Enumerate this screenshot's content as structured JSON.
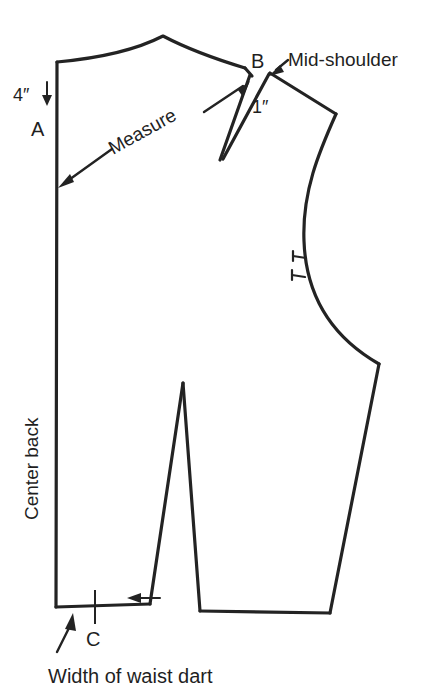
{
  "diagram": {
    "title": "BACK",
    "piece_label": "BACK",
    "labels": {
      "point_a": "A",
      "point_b": "B",
      "point_c": "C",
      "center_back": "Center back",
      "measure": "Measure",
      "mid_shoulder": "Mid-shoulder",
      "dim_four_inch": "4″",
      "dim_one_inch": "1″",
      "caption_waist_dart": "Width of waist dart"
    },
    "measurements": [
      {
        "id": "neck-drop",
        "value": "4″",
        "description": "distance down center back from neckline to point A"
      },
      {
        "id": "shoulder-dart-width",
        "value": "1″",
        "description": "width of shoulder dart at point B"
      }
    ],
    "points": [
      {
        "id": "A",
        "label": "A",
        "x": 57,
        "y": 137
      },
      {
        "id": "B",
        "label": "B",
        "x": 272,
        "y": 72
      },
      {
        "id": "C",
        "label": "C",
        "x": 95,
        "y": 607
      }
    ],
    "colors": {
      "outline": "#232323",
      "text": "#1f1f1f",
      "background": "#ffffff"
    },
    "geometry": {
      "center_back_line": "M 57,62 L 56,607",
      "neckline": "M 57,62 C 90,59 130,52 163,36 C 180,45 210,58 243,68",
      "shoulder_right": "M 272,72 L 335,113",
      "armhole": "M 335,113 C 320,150 303,190 304,240 C 305,295 330,335 378,363",
      "side_seam": "M 378,363 L 330,613",
      "waist_right": "M 330,613 L 200,611",
      "waist_left": "M 150,604 L 56,607",
      "shoulder_left_to_dart": "M 243,68 L 251,76",
      "shoulder_dart_left_leg": "M 247,73 L 221,158",
      "shoulder_dart_right_leg": "M 266,76 L 224,158",
      "waist_dart_left_leg": "M 150,604 L 183,383",
      "waist_dart_right_leg": "M 183,383 L 200,611"
    },
    "notches": [
      {
        "id": "armhole-notch-upper",
        "x": 304,
        "y": 258
      },
      {
        "id": "armhole-notch-lower",
        "x": 303,
        "y": 276
      }
    ],
    "annotations": [
      {
        "id": "measure-arrow",
        "target": "point A on center back",
        "text": "Measure"
      },
      {
        "id": "mid-shoulder-arrow",
        "target": "point B",
        "text": "Mid-shoulder"
      },
      {
        "id": "waist-dart-arrow",
        "target": "waistline at dart",
        "text": "Width of waist dart"
      }
    ]
  }
}
